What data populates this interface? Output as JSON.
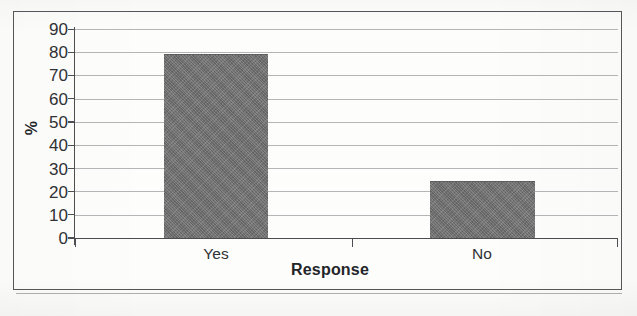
{
  "chart_data": {
    "type": "bar",
    "title": "",
    "subtitle": "",
    "categories": [
      "Yes",
      "No"
    ],
    "values": [
      79,
      24
    ],
    "series": [
      {
        "name": "Response",
        "values": [
          79,
          24
        ]
      }
    ],
    "xlabel": "Response",
    "ylabel": "%",
    "ylim": [
      0,
      90
    ],
    "ytick_step": 10,
    "yticks": [
      90,
      80,
      70,
      60,
      50,
      40,
      30,
      20,
      10,
      0
    ],
    "ytick_labels": [
      "90",
      "80",
      "70",
      "60",
      "50",
      "40",
      "30",
      "20",
      "10",
      "0"
    ],
    "grid": true,
    "grid_axis": "y",
    "legend": false,
    "legend_position": "none",
    "bar_color": "#727272",
    "axis_color": "#4c4e52",
    "gridline_color": "#787a7e",
    "text_color": "#2f3134",
    "plot_background": "#ffffff",
    "frame_border_color": "#54565a",
    "annotations": []
  },
  "figure": {
    "border_label": "chart-frame",
    "background": "#fdfdfc"
  }
}
